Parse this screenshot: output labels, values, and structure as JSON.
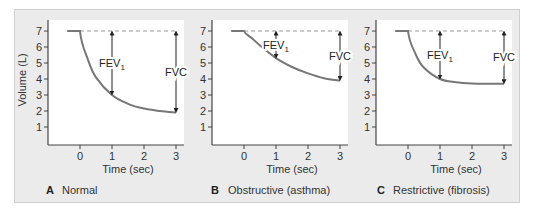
{
  "figure": {
    "panels": [
      {
        "letter": "A",
        "caption": "Normal"
      },
      {
        "letter": "B",
        "caption": "Obstructive (asthma)"
      },
      {
        "letter": "C",
        "caption": "Restrictive (fibrosis)"
      }
    ],
    "ylabel": "Volume (L)",
    "xlabel": "Time (sec)",
    "fev1_label": "FEV",
    "fev1_sub": "1",
    "fvc_label": "FVC",
    "colors": {
      "background": "#ebebeb",
      "plot_area": "#ffffff",
      "curve": "#777777",
      "dashed": "#999999",
      "axis": "#444444",
      "arrow": "#222222"
    }
  },
  "chart_data": [
    {
      "type": "line",
      "title": "A Normal",
      "xlabel": "Time (sec)",
      "ylabel": "Volume (L)",
      "x_ticks": [
        0,
        1,
        2,
        3
      ],
      "y_ticks": [
        1,
        2,
        3,
        4,
        5,
        6,
        7
      ],
      "ylim": [
        0,
        7.5
      ],
      "xlim": [
        -1,
        3.2
      ],
      "grid": false,
      "series": [
        {
          "name": "Volume",
          "x": [
            -0.4,
            0,
            0.25,
            0.5,
            1,
            1.5,
            2,
            2.5,
            3
          ],
          "y": [
            7,
            7,
            5.2,
            4.1,
            3.0,
            2.45,
            2.15,
            2.0,
            1.9
          ]
        }
      ],
      "reference_line": {
        "y": 7,
        "style": "dashed"
      },
      "annotations": [
        {
          "label": "FEV1",
          "x": 1,
          "from": 7,
          "to": 3.0
        },
        {
          "label": "FVC",
          "x": 3,
          "from": 7,
          "to": 1.9
        }
      ]
    },
    {
      "type": "line",
      "title": "B Obstructive (asthma)",
      "xlabel": "Time (sec)",
      "ylabel": "",
      "x_ticks": [
        0,
        1,
        2,
        3
      ],
      "y_ticks": [
        1,
        2,
        3,
        4,
        5,
        6,
        7
      ],
      "ylim": [
        0,
        7.5
      ],
      "xlim": [
        -1,
        3.2
      ],
      "grid": false,
      "series": [
        {
          "name": "Volume",
          "x": [
            -0.4,
            0,
            0.25,
            0.5,
            1,
            1.5,
            2,
            2.5,
            3
          ],
          "y": [
            7,
            7,
            6.55,
            6.1,
            5.3,
            4.75,
            4.35,
            4.05,
            3.9
          ]
        }
      ],
      "reference_line": {
        "y": 7,
        "style": "dashed"
      },
      "annotations": [
        {
          "label": "FEV1",
          "x": 1,
          "from": 7,
          "to": 5.3
        },
        {
          "label": "FVC",
          "x": 3,
          "from": 7,
          "to": 3.9
        }
      ]
    },
    {
      "type": "line",
      "title": "C Restrictive (fibrosis)",
      "xlabel": "Time (sec)",
      "ylabel": "",
      "x_ticks": [
        0,
        1,
        2,
        3
      ],
      "y_ticks": [
        1,
        2,
        3,
        4,
        5,
        6,
        7
      ],
      "ylim": [
        0,
        7.5
      ],
      "xlim": [
        -1,
        3.2
      ],
      "grid": false,
      "series": [
        {
          "name": "Volume",
          "x": [
            -0.4,
            0,
            0.25,
            0.5,
            1,
            1.5,
            2,
            2.5,
            3
          ],
          "y": [
            7,
            7,
            5.5,
            4.7,
            4.0,
            3.8,
            3.72,
            3.7,
            3.7
          ]
        }
      ],
      "reference_line": {
        "y": 7,
        "style": "dashed"
      },
      "annotations": [
        {
          "label": "FEV1",
          "x": 1,
          "from": 7,
          "to": 4.0
        },
        {
          "label": "FVC",
          "x": 3,
          "from": 7,
          "to": 3.7
        }
      ]
    }
  ]
}
